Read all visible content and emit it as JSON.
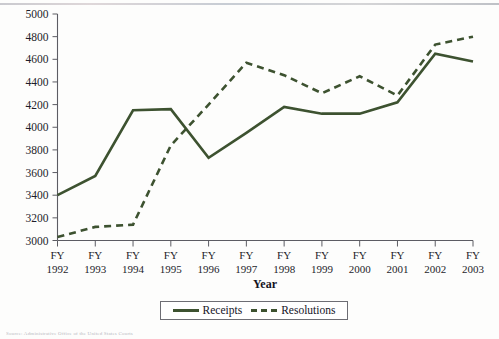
{
  "chart_data": {
    "type": "line",
    "title": "",
    "xlabel": "Year",
    "ylabel": "",
    "categories": [
      "FY 1992",
      "FY 1993",
      "FY 1994",
      "FY 1995",
      "FY 1996",
      "FY 1997",
      "FY 1998",
      "FY 1999",
      "FY 2000",
      "FY 2001",
      "FY 2002",
      "FY 2003"
    ],
    "category_lines": [
      [
        "FY",
        "1992"
      ],
      [
        "FY",
        "1993"
      ],
      [
        "FY",
        "1994"
      ],
      [
        "FY",
        "1995"
      ],
      [
        "FY",
        "1996"
      ],
      [
        "FY",
        "1997"
      ],
      [
        "FY",
        "1998"
      ],
      [
        "FY",
        "1999"
      ],
      [
        "FY",
        "2000"
      ],
      [
        "FY",
        "2001"
      ],
      [
        "FY",
        "2002"
      ],
      [
        "FY",
        "2003"
      ]
    ],
    "series": [
      {
        "name": "Receipts",
        "style": "solid",
        "color": "#3d5230",
        "values": [
          3400,
          3570,
          4150,
          4160,
          3730,
          3950,
          4180,
          4120,
          4120,
          4220,
          4650,
          4580
        ]
      },
      {
        "name": "Resolutions",
        "style": "dashed",
        "color": "#3d5230",
        "values": [
          3030,
          3120,
          3140,
          3840,
          4200,
          4570,
          4460,
          4300,
          4450,
          4280,
          4730,
          4800
        ]
      }
    ],
    "ylim": [
      3000,
      5000
    ],
    "yticks": [
      3000,
      3200,
      3400,
      3600,
      3800,
      4000,
      4200,
      4400,
      4600,
      4800,
      5000
    ],
    "grid": false,
    "legend_position": "bottom"
  },
  "legend": {
    "entries": [
      {
        "label": "Receipts",
        "style": "solid"
      },
      {
        "label": "Resolutions",
        "style": "dashed"
      }
    ]
  },
  "footer": {
    "source_note": "Source: Administrative Office of the United States Courts"
  }
}
